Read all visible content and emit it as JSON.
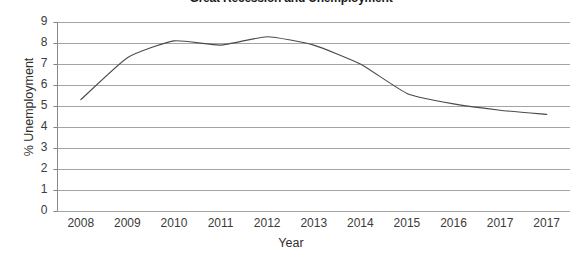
{
  "chart_data": {
    "type": "line",
    "title": "Great Recession and Unemployment",
    "xlabel": "Year",
    "ylabel": "% Unemployment",
    "categories": [
      "2008",
      "2009",
      "2010",
      "2011",
      "2012",
      "2013",
      "2014",
      "2015",
      "2016",
      "2017",
      "2017"
    ],
    "values": [
      5.3,
      7.3,
      8.1,
      7.9,
      8.3,
      7.9,
      7.0,
      5.6,
      5.1,
      4.8,
      4.6
    ],
    "series": [
      {
        "name": "% Unemployment",
        "values": [
          5.3,
          7.3,
          8.1,
          7.9,
          8.3,
          7.9,
          7.0,
          5.6,
          5.1,
          4.8,
          4.6
        ]
      }
    ],
    "ylim": [
      0,
      9
    ],
    "yticks": [
      0,
      1,
      2,
      3,
      4,
      5,
      6,
      7,
      8,
      9
    ],
    "ytick_labels": [
      "0",
      "1",
      "2",
      "3",
      "4",
      "5",
      "6",
      "7",
      "8",
      "9"
    ],
    "grid": true,
    "grid_axis": "y",
    "legend": false,
    "legend_position": "none",
    "line_color": "#4a4a4a",
    "grid_color": "#9a9a9a",
    "axis_color": "#808080",
    "background_color": "#ffffff",
    "smoothing": true
  }
}
